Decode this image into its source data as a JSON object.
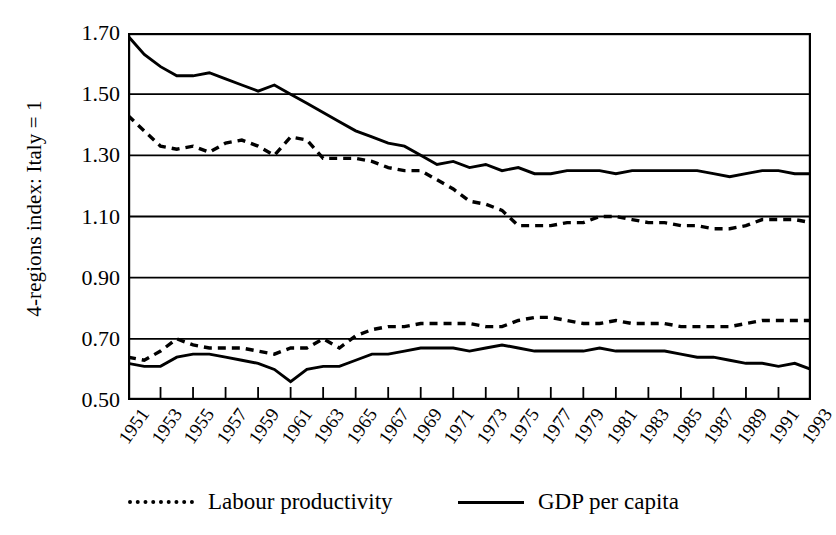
{
  "chart_data": {
    "type": "line",
    "title": "",
    "xlabel": "",
    "ylabel": "4-regions index: Italy = 1",
    "ylim": [
      0.5,
      1.7
    ],
    "ytick_labels": [
      "1.70",
      "1.50",
      "1.30",
      "1.10",
      "0.90",
      "0.70",
      "0.50"
    ],
    "ytick_values": [
      1.7,
      1.5,
      1.3,
      1.1,
      0.9,
      0.7,
      0.5
    ],
    "grid": "horizontal",
    "legend_position": "below",
    "xlim": [
      1951,
      1993
    ],
    "x": [
      1951,
      1952,
      1953,
      1954,
      1955,
      1956,
      1957,
      1958,
      1959,
      1960,
      1961,
      1962,
      1963,
      1964,
      1965,
      1966,
      1967,
      1968,
      1969,
      1970,
      1971,
      1972,
      1973,
      1974,
      1975,
      1976,
      1977,
      1978,
      1979,
      1980,
      1981,
      1982,
      1983,
      1984,
      1985,
      1986,
      1987,
      1988,
      1989,
      1990,
      1991,
      1992,
      1993
    ],
    "xtick_labels": [
      "1951",
      "1953",
      "1955",
      "1957",
      "1959",
      "1961",
      "1963",
      "1965",
      "1967",
      "1969",
      "1971",
      "1973",
      "1975",
      "1977",
      "1979",
      "1981",
      "1983",
      "1985",
      "1987",
      "1989",
      "1991",
      "1993"
    ],
    "xtick_values": [
      1951,
      1953,
      1955,
      1957,
      1959,
      1961,
      1963,
      1965,
      1967,
      1969,
      1971,
      1973,
      1975,
      1977,
      1979,
      1981,
      1983,
      1985,
      1987,
      1989,
      1991,
      1993
    ],
    "series": [
      {
        "name": "Labour productivity",
        "group": "North-Centre",
        "style": "dashed",
        "color": "#000000",
        "values": [
          1.43,
          1.38,
          1.33,
          1.32,
          1.33,
          1.31,
          1.34,
          1.35,
          1.33,
          1.3,
          1.36,
          1.35,
          1.29,
          1.29,
          1.29,
          1.28,
          1.26,
          1.25,
          1.25,
          1.22,
          1.19,
          1.15,
          1.14,
          1.12,
          1.07,
          1.07,
          1.07,
          1.08,
          1.08,
          1.1,
          1.1,
          1.09,
          1.08,
          1.08,
          1.07,
          1.07,
          1.06,
          1.06,
          1.07,
          1.09,
          1.09,
          1.09,
          1.08
        ]
      },
      {
        "name": "GDP per capita",
        "group": "North-Centre",
        "style": "solid",
        "color": "#000000",
        "values": [
          1.69,
          1.63,
          1.59,
          1.56,
          1.56,
          1.57,
          1.55,
          1.53,
          1.51,
          1.53,
          1.5,
          1.47,
          1.44,
          1.41,
          1.38,
          1.36,
          1.34,
          1.33,
          1.3,
          1.27,
          1.28,
          1.26,
          1.27,
          1.25,
          1.26,
          1.24,
          1.24,
          1.25,
          1.25,
          1.25,
          1.24,
          1.25,
          1.25,
          1.25,
          1.25,
          1.25,
          1.24,
          1.23,
          1.24,
          1.25,
          1.25,
          1.24,
          1.24
        ]
      },
      {
        "name": "Labour productivity",
        "group": "South",
        "style": "dashed",
        "color": "#000000",
        "values": [
          0.64,
          0.63,
          0.66,
          0.7,
          0.68,
          0.67,
          0.67,
          0.67,
          0.66,
          0.65,
          0.67,
          0.67,
          0.7,
          0.67,
          0.71,
          0.73,
          0.74,
          0.74,
          0.75,
          0.75,
          0.75,
          0.75,
          0.74,
          0.74,
          0.76,
          0.77,
          0.77,
          0.76,
          0.75,
          0.75,
          0.76,
          0.75,
          0.75,
          0.75,
          0.74,
          0.74,
          0.74,
          0.74,
          0.75,
          0.76,
          0.76,
          0.76,
          0.76
        ]
      },
      {
        "name": "GDP per capita",
        "group": "South",
        "style": "solid",
        "color": "#000000",
        "values": [
          0.62,
          0.61,
          0.61,
          0.64,
          0.65,
          0.65,
          0.64,
          0.63,
          0.62,
          0.6,
          0.56,
          0.6,
          0.61,
          0.61,
          0.63,
          0.65,
          0.65,
          0.66,
          0.67,
          0.67,
          0.67,
          0.66,
          0.67,
          0.68,
          0.67,
          0.66,
          0.66,
          0.66,
          0.66,
          0.67,
          0.66,
          0.66,
          0.66,
          0.66,
          0.65,
          0.64,
          0.64,
          0.63,
          0.62,
          0.62,
          0.61,
          0.62,
          0.6
        ]
      }
    ],
    "legend_entries": [
      {
        "label": "Labour productivity",
        "style": "dashed"
      },
      {
        "label": "GDP per capita",
        "style": "solid"
      }
    ]
  }
}
